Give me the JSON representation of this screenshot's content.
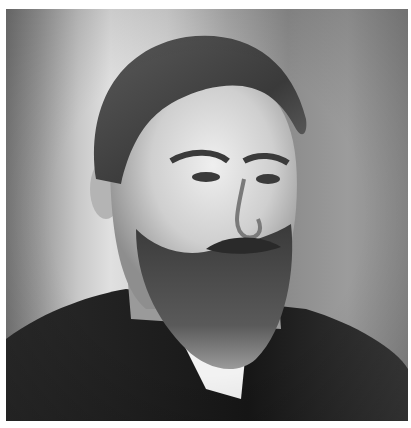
{
  "image": {
    "description": "Black and white portrait photograph of a bearded man with swept-back hair, wearing a dark suit and white collar",
    "style": "grayscale",
    "colors": {
      "background_light": "#e0e0e0",
      "background_dark": "#7a7a7a",
      "hair": "#3a3a3a",
      "skin": "#d8d8d8",
      "beard": "#4a4a4a",
      "suit": "#1e1e1e",
      "collar": "#f2f2f2",
      "margin": "#ffffff"
    }
  }
}
